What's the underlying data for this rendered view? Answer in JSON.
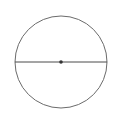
{
  "caption": {
    "text": "",
    "note": "text cut off at top edge; illegible"
  },
  "diagram": {
    "type": "circle-with-diameter",
    "circle": {
      "cx": 61,
      "cy": 62,
      "r": 46,
      "stroke": "#6b6b6b"
    },
    "diameter": {
      "x1": 15,
      "y1": 62,
      "x2": 107,
      "y2": 62,
      "stroke": "#4a4a4a"
    },
    "center_point": {
      "cx": 61,
      "cy": 62,
      "r": 1.8,
      "fill": "#333333"
    }
  }
}
